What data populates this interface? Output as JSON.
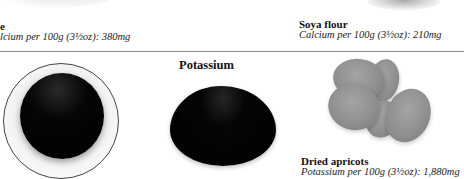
{
  "top_row": {
    "left_item": {
      "name": "e",
      "info": "lcium per 100g (3½oz): 380mg"
    },
    "right_item": {
      "name": "Soya flour",
      "info": "Calcium per 100g (3½oz): 210mg"
    }
  },
  "section": {
    "title": "Potassium",
    "item": {
      "name": "Dried apricots",
      "info": "Potassium per 100g (3½oz): 1,880mg"
    }
  },
  "images": {
    "plate": "dark-liquid-on-plate",
    "oval": "dark-oval-food",
    "apricots": "dried-apricots-photo"
  }
}
